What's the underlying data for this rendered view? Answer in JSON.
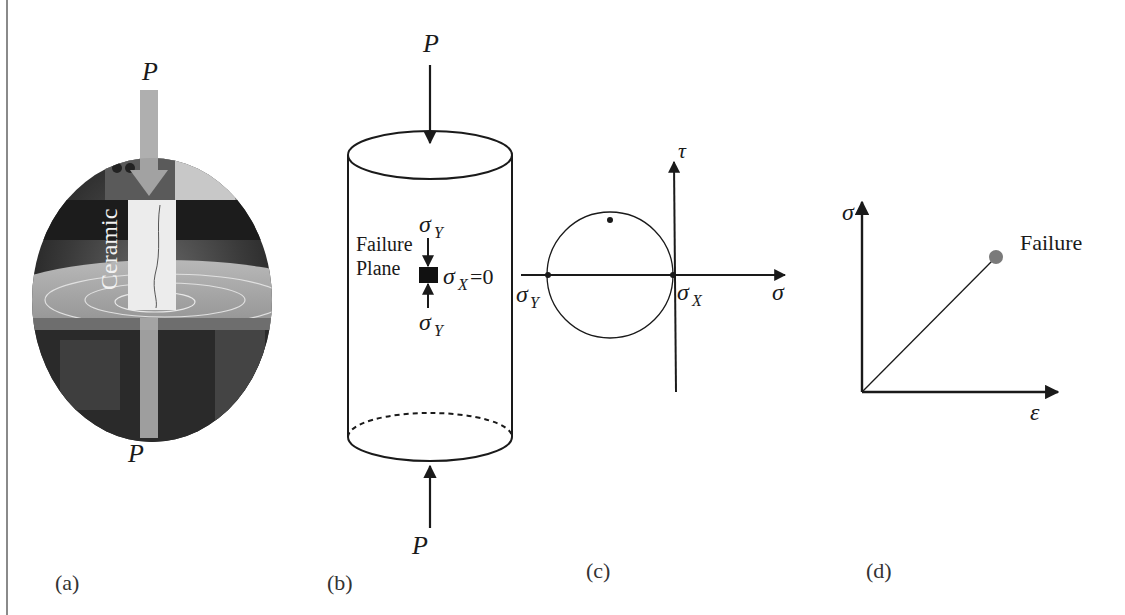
{
  "panels": {
    "a": {
      "label": "(a)",
      "load_top": "P",
      "load_bottom": "P",
      "specimen_text": "Ceramic"
    },
    "b": {
      "label": "(b)",
      "load_top": "P",
      "load_bottom": "P",
      "plane_label_line1": "Failure",
      "plane_label_line2": "Plane",
      "sigma_y_top": "σ",
      "sigma_y_top_sub": "Y",
      "sigma_y_bottom": "σ",
      "sigma_y_bottom_sub": "Y",
      "sigma_x": "σ",
      "sigma_x_sub": "X",
      "sigma_x_value": "=0"
    },
    "c": {
      "label": "(c)",
      "axis_x": "σ",
      "axis_y": "τ",
      "point_left": "σ",
      "point_left_sub": "Y",
      "point_right": "σ",
      "point_right_sub": "X"
    },
    "d": {
      "label": "(d)",
      "axis_x": "ε",
      "axis_y": "σ",
      "failure_label": "Failure",
      "failure_color": "#7a7a7a"
    }
  }
}
